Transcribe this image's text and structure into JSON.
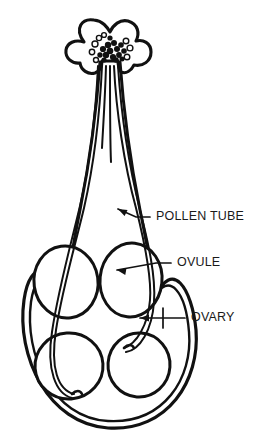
{
  "figure": {
    "background_color": "#ffffff",
    "ink_color": "#111111",
    "width": 264,
    "height": 440
  },
  "labels": [
    {
      "id": "pollen-tube",
      "text": "POLLEN TUBE",
      "text_x": 156,
      "text_y": 217,
      "leader": "M 150 217 L 136 217 L 118 209",
      "arrow_x": 118,
      "arrow_y": 209,
      "arrow_angle": 206
    },
    {
      "id": "ovule",
      "text": "OVULE",
      "text_x": 177,
      "text_y": 263,
      "leader": "M 171 263 L 156 263 L 117 270",
      "arrow_x": 117,
      "arrow_y": 270,
      "arrow_angle": 190
    },
    {
      "id": "ovary",
      "text": "OVARY",
      "text_x": 191,
      "text_y": 318,
      "leader": "M 185 318 L 140 318",
      "tick": "M 163 308 L 163 328",
      "arrow_x": 140,
      "arrow_y": 318,
      "arrow_angle": 180
    }
  ],
  "structures": {
    "stigma": {
      "name": "stigma",
      "outline": "M 84 42 C 74 28 82 18 94 20 C 103 21 107 27 110 32 C 113 25 120 19 128 21 C 138 24 140 33 136 41 C 143 39 151 43 151 52 C 151 61 143 67 134 65 C 131 71 126 74 121 72 C 119 69 118 65 118 61 L 102 61 C 102 66 100 71 95 73 C 88 75 81 70 80 63 C 72 64 65 58 66 50 C 67 43 75 39 84 42 Z"
    },
    "style": {
      "name": "style",
      "left_wall": "M 100 62 C 98 90 92 150 80 210 C 74 240 68 270 66 300",
      "right_wall": "M 120 62 C 122 90 128 150 140 210 C 146 240 152 268 155 298"
    },
    "ovary": {
      "name": "ovary-wall",
      "outer": "M 66 300 C 54 262 30 258 24 300 C 16 356 48 424 108 428 C 168 432 200 380 196 330 C 192 288 172 258 155 298",
      "inner": "M 70 300 C 58 268 36 266 31 302 C 24 354 52 418 108 421 C 164 424 193 378 189 332 C 186 294 170 268 152 300"
    },
    "ovules": [
      {
        "id": "ovule-top-left",
        "cx": 66,
        "cy": 282,
        "rx": 32,
        "ry": 36,
        "rot": -8
      },
      {
        "id": "ovule-top-right",
        "cx": 131,
        "cy": 280,
        "rx": 31,
        "ry": 37,
        "rot": 6
      },
      {
        "id": "ovule-bottom-left",
        "cx": 69,
        "cy": 366,
        "rx": 34,
        "ry": 33,
        "rot": -4
      },
      {
        "id": "ovule-bottom-right",
        "cx": 139,
        "cy": 365,
        "rx": 31,
        "ry": 32,
        "rot": 4
      }
    ],
    "pollen_tubes": [
      {
        "id": "tube-1-short",
        "path": "M 106 66 C 105 100 103 128 102 148"
      },
      {
        "id": "tube-2-short",
        "path": "M 110 66 C 110 104 110 140 111 162"
      },
      {
        "id": "tube-3-right",
        "path": "M 114 66 C 116 110 124 164 136 208 C 144 240 152 276 150 300 C 148 326 136 344 124 348"
      },
      {
        "id": "tube-4-right-inner",
        "path": "M 118 66 C 121 112 129 166 140 210 C 148 242 156 276 154 302 C 152 330 140 350 126 352"
      },
      {
        "id": "tube-5-left",
        "path": "M 102 66 C 100 110 94 164 84 208 C 76 242 62 290 56 330 C 50 368 58 390 74 394"
      },
      {
        "id": "tube-6-left-inner",
        "path": "M 98 66 C 96 108 90 162 80 206 C 72 240 58 290 52 332 C 46 370 56 394 72 398"
      }
    ],
    "micropyle_entries": [
      {
        "id": "entry-top-right-ovule",
        "path": "M 124 348 C 128 344 132 344 134 348"
      },
      {
        "id": "entry-bottom-left-ovule",
        "path": "M 72 394 C 76 390 80 390 82 394"
      }
    ],
    "pollen_grains": {
      "name": "pollen-grains",
      "filled": [
        {
          "cx": 108,
          "cy": 45,
          "r": 3.2
        },
        {
          "cx": 114,
          "cy": 43,
          "r": 3.0
        },
        {
          "cx": 103,
          "cy": 49,
          "r": 3.1
        },
        {
          "cx": 110,
          "cy": 51,
          "r": 3.3
        },
        {
          "cx": 117,
          "cy": 49,
          "r": 3.0
        },
        {
          "cx": 121,
          "cy": 45,
          "r": 2.8
        },
        {
          "cx": 106,
          "cy": 55,
          "r": 3.2
        },
        {
          "cx": 113,
          "cy": 57,
          "r": 3.1
        },
        {
          "cx": 119,
          "cy": 55,
          "r": 2.9
        },
        {
          "cx": 100,
          "cy": 55,
          "r": 2.7
        },
        {
          "cx": 124,
          "cy": 51,
          "r": 2.8
        },
        {
          "cx": 110,
          "cy": 38,
          "r": 2.6
        },
        {
          "cx": 116,
          "cy": 60,
          "r": 2.7
        },
        {
          "cx": 104,
          "cy": 60,
          "r": 2.6
        },
        {
          "cx": 122,
          "cy": 59,
          "r": 2.5
        }
      ],
      "hollow": [
        {
          "cx": 95,
          "cy": 44,
          "r": 3.0
        },
        {
          "cx": 99,
          "cy": 38,
          "r": 2.6
        },
        {
          "cx": 126,
          "cy": 41,
          "r": 2.8
        },
        {
          "cx": 130,
          "cy": 48,
          "r": 2.9
        },
        {
          "cx": 92,
          "cy": 52,
          "r": 2.7
        },
        {
          "cx": 127,
          "cy": 57,
          "r": 2.8
        },
        {
          "cx": 96,
          "cy": 60,
          "r": 2.5
        },
        {
          "cx": 104,
          "cy": 35,
          "r": 2.4
        }
      ]
    }
  }
}
